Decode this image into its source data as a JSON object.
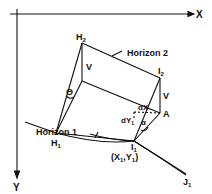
{
  "axes": {
    "x_label": "X",
    "y_label": "Y"
  },
  "points": {
    "H2": {
      "main": "H",
      "sub": "2"
    },
    "H1": {
      "main": "H",
      "sub": "1"
    },
    "I2": {
      "main": "I",
      "sub": "2"
    },
    "I1": {
      "main": "I",
      "sub": "1"
    },
    "J1": {
      "main": "J",
      "sub": "1"
    },
    "A": {
      "main": "A"
    }
  },
  "labels": {
    "horizon2": "Horizon 2",
    "horizon1": "Horizon 1",
    "v_left": "V",
    "v_right": "V",
    "theta": "Θ",
    "alpha": "α",
    "dx": "dX",
    "dy": "dY",
    "dy_sub": "1",
    "coord": "(X",
    "coord_sub1": "1",
    "coord_mid": ",Y",
    "coord_sub2": "1",
    "coord_end": ")"
  },
  "colors": {
    "ink": "#111111",
    "background": "#ffffff"
  }
}
